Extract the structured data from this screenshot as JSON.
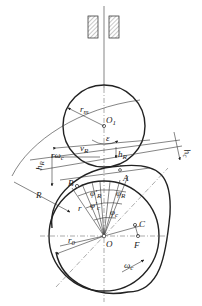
{
  "diagram": {
    "title": "",
    "labels": {
      "r_m": "r",
      "r_m_sub": "m",
      "O1": "O",
      "O1_sub": "1",
      "v_R": "v",
      "v_R_sub": "R",
      "h_R_right": "h",
      "h_R_right_sub": "R",
      "h_R_left": "h",
      "h_R_left_sub": "R",
      "r_omega_c": "rω",
      "r_omega_c_sub": "c",
      "R": "R",
      "h_c": "h",
      "h_c_sub": "c",
      "B": "B",
      "A": "A",
      "phi_R_prime": "φ'",
      "phi_R_prime_sub": "R",
      "phi_R": "φ",
      "phi_R_sub": "R",
      "phi_c_prime": "φ'",
      "phi_c_prime_sub": "c",
      "phi_c": "φ",
      "phi_c_sub": "c",
      "r": "r",
      "epsilon": "ε",
      "C": "C",
      "F": "F",
      "O": "O",
      "r0": "r",
      "r0_sub": "0",
      "omega_c": "ω",
      "omega_c_sub": "c"
    },
    "colors": {
      "line": "#222222",
      "background": "#ffffff",
      "hatch": "#444444"
    }
  }
}
